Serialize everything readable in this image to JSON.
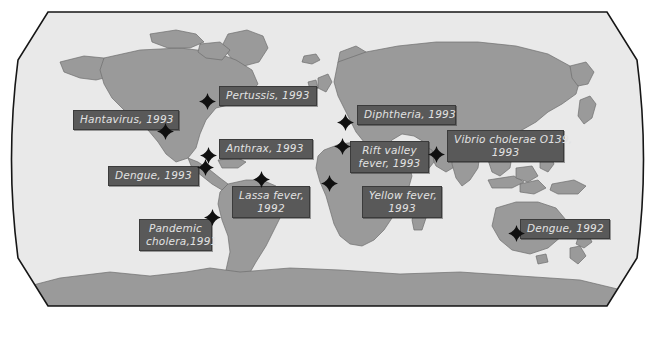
{
  "figure": {
    "name": "world-outbreak-map",
    "projection": "robinson",
    "width": 655,
    "height": 355
  },
  "colors": {
    "page_background": "#ffffff",
    "ocean": "#e9e9e9",
    "land": "#9a9a9a",
    "land_outline": "#6f6f6f",
    "map_border": "#161616",
    "label_box": "#595959",
    "label_border": "#3b3b3b",
    "label_text": "#e2e2e2",
    "marker": "#101010"
  },
  "map": {
    "ocean_label": "ocean",
    "land_label": "landmass",
    "border_label": "map-outline"
  },
  "outbreaks": [
    {
      "id": "hantavirus-1993",
      "disease": "Hantavirus",
      "year": "1993",
      "label": "Hantavirus, 1993",
      "lines": [
        "Hantavirus, 1993"
      ],
      "region": "north-america-west",
      "box": {
        "x": 73,
        "y": 110,
        "width": 106,
        "height": 18
      },
      "marker": {
        "x": 165,
        "y": 131
      },
      "align": "left"
    },
    {
      "id": "pertussis-1993",
      "disease": "Pertussis",
      "year": "1993",
      "label": "Pertussis, 1993",
      "lines": [
        "Pertussis, 1993"
      ],
      "region": "north-america-east",
      "box": {
        "x": 219,
        "y": 86,
        "width": 98,
        "height": 18
      },
      "marker": {
        "x": 207,
        "y": 101
      },
      "align": "left"
    },
    {
      "id": "dengue-1993",
      "disease": "Dengue",
      "year": "1993",
      "label": "Dengue, 1993",
      "lines": [
        "Dengue, 1993"
      ],
      "region": "central-america",
      "box": {
        "x": 108,
        "y": 166,
        "width": 91,
        "height": 18
      },
      "marker": {
        "x": 205,
        "y": 167
      },
      "align": "left"
    },
    {
      "id": "anthrax-1993",
      "disease": "Anthrax",
      "year": "1993",
      "label": "Anthrax, 1993",
      "lines": [
        "Anthrax, 1993"
      ],
      "region": "atlantic",
      "box": {
        "x": 219,
        "y": 139,
        "width": 94,
        "height": 18
      },
      "marker": {
        "x": 208,
        "y": 155
      },
      "align": "left"
    },
    {
      "id": "diphtheria-1993",
      "disease": "Diphtheria",
      "year": "1993",
      "label": "Diphtheria, 1993",
      "lines": [
        "Diphtheria, 1993"
      ],
      "region": "eastern-europe",
      "box": {
        "x": 357,
        "y": 105,
        "width": 99,
        "height": 18
      },
      "marker": {
        "x": 345,
        "y": 122
      },
      "align": "left"
    },
    {
      "id": "rift-valley-fever-1993",
      "disease": "Rift valley fever",
      "year": "1993",
      "label": "Rift valley fever, 1993",
      "lines": [
        "Rift valley",
        "fever, 1993"
      ],
      "region": "northeast-africa",
      "box": {
        "x": 350,
        "y": 141,
        "width": 79,
        "height": 31
      },
      "marker": {
        "x": 342,
        "y": 146
      },
      "align": "center"
    },
    {
      "id": "vibrio-cholerae-o139-1993",
      "disease": "Vibrio cholerae O139",
      "year": "1993",
      "label": "Vibrio cholerae O139, 1993",
      "lines": [
        "Vibrio cholerae O139,",
        "1993"
      ],
      "region": "south-asia",
      "box": {
        "x": 447,
        "y": 130,
        "width": 117,
        "height": 31
      },
      "marker": {
        "x": 436,
        "y": 154
      },
      "align": "center"
    },
    {
      "id": "lassa-fever-1992",
      "disease": "Lassa fever",
      "year": "1992",
      "label": "Lassa fever, 1992",
      "lines": [
        "Lassa fever,",
        "1992"
      ],
      "region": "west-africa",
      "box": {
        "x": 232,
        "y": 186,
        "width": 78,
        "height": 31
      },
      "marker": {
        "x": 261,
        "y": 179
      },
      "align": "center"
    },
    {
      "id": "yellow-fever-1993",
      "disease": "Yellow fever",
      "year": "1993",
      "label": "Yellow fever, 1993",
      "lines": [
        "Yellow fever,",
        "1993"
      ],
      "region": "central-africa",
      "box": {
        "x": 362,
        "y": 186,
        "width": 80,
        "height": 31
      },
      "marker": {
        "x": 329,
        "y": 183
      },
      "align": "center"
    },
    {
      "id": "pandemic-cholera-1991",
      "disease": "Pandemic cholera",
      "year": "1991",
      "label": "Pandemic cholera,1991",
      "lines": [
        "Pandemic",
        "cholera,1991"
      ],
      "region": "south-america",
      "box": {
        "x": 139,
        "y": 219,
        "width": 73,
        "height": 31
      },
      "marker": {
        "x": 212,
        "y": 217
      },
      "align": "center"
    },
    {
      "id": "dengue-1992",
      "disease": "Dengue",
      "year": "1992",
      "label": "Dengue, 1992",
      "lines": [
        "Dengue, 1992"
      ],
      "region": "australia",
      "box": {
        "x": 520,
        "y": 219,
        "width": 90,
        "height": 18
      },
      "marker": {
        "x": 516,
        "y": 233
      },
      "align": "left"
    }
  ]
}
